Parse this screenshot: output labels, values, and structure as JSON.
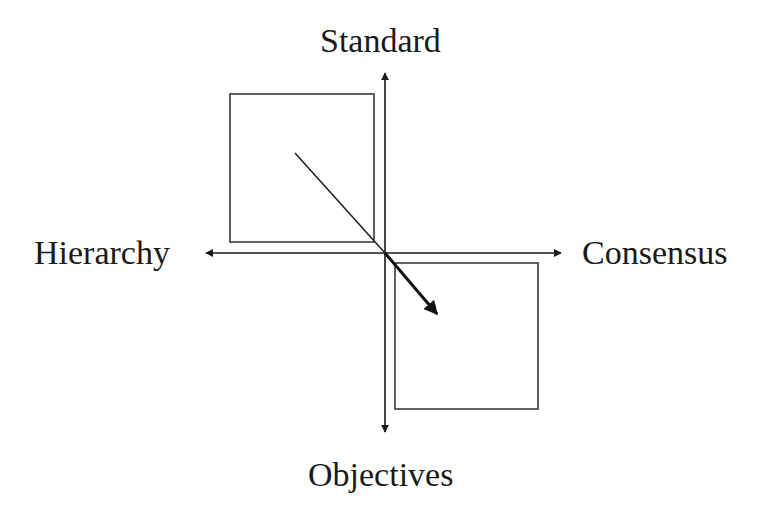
{
  "diagram": {
    "type": "quadrant-axes",
    "axes": {
      "vertical": {
        "top_label": "Standard",
        "bottom_label": "Objectives"
      },
      "horizontal": {
        "left_label": "Hierarchy",
        "right_label": "Consensus"
      }
    },
    "boxes": [
      {
        "name": "upper-left-square",
        "quadrant": "Hierarchy-Standard"
      },
      {
        "name": "lower-right-square",
        "quadrant": "Consensus-Objectives"
      }
    ],
    "shift_arrow": {
      "from_quadrant": "Hierarchy-Standard",
      "to_quadrant": "Consensus-Objectives"
    },
    "colors": {
      "stroke": "#1a1a1a",
      "box_stroke": "#3a3a3a",
      "background": "#ffffff"
    }
  }
}
